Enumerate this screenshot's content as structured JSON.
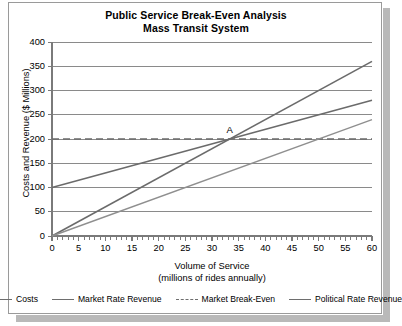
{
  "chart_data": {
    "type": "line",
    "title": "Public Service Break-Even Analysis",
    "subtitle": "Mass Transit System",
    "xlabel": "Volume of Service",
    "xlabel_sub": "(millions of rides annually)",
    "ylabel": "Costs and Revenue ($ Millions)",
    "xlim": [
      0,
      60
    ],
    "ylim": [
      0,
      400
    ],
    "xticks": [
      0,
      5,
      10,
      15,
      20,
      25,
      30,
      35,
      40,
      45,
      50,
      55,
      60
    ],
    "xtick_labels": [
      "0",
      "5",
      "10",
      "15",
      "20",
      "25",
      "30",
      "35",
      "40",
      "45",
      "50",
      "55",
      "60"
    ],
    "x_minor_tick_step": 1,
    "yticks": [
      0,
      50,
      100,
      150,
      200,
      250,
      300,
      350,
      400
    ],
    "ytick_labels": [
      "0",
      "50",
      "100",
      "150",
      "200",
      "250",
      "300",
      "350",
      "400"
    ],
    "grid": "horizontal",
    "legend_position": "bottom",
    "series": [
      {
        "name": "Costs",
        "style": "solid",
        "color": "#6b6b6b",
        "width": 1.6,
        "x": [
          0,
          60
        ],
        "y": [
          100,
          280
        ]
      },
      {
        "name": "Market Rate Revenue",
        "style": "solid",
        "color": "#6b6b6b",
        "width": 1.6,
        "x": [
          0,
          60
        ],
        "y": [
          0,
          360
        ]
      },
      {
        "name": "Market Break-Even",
        "style": "dashed",
        "color": "#6b6b6b",
        "width": 1.6,
        "x": [
          0,
          60
        ],
        "y": [
          200,
          200
        ]
      },
      {
        "name": "Political Rate Revenue",
        "style": "solid",
        "color": "#8f8f8f",
        "width": 1.4,
        "x": [
          0,
          60
        ],
        "y": [
          0,
          240
        ]
      }
    ],
    "annotations": [
      {
        "label": "A",
        "x": 33.3,
        "y": 200,
        "note": "Break-even intersection of Costs and Market Rate Revenue"
      }
    ]
  },
  "legend": {
    "items": [
      {
        "label": "Costs",
        "style": "solid"
      },
      {
        "label": "Market Rate Revenue",
        "style": "solid"
      },
      {
        "label": "Market Break-Even",
        "style": "dashed"
      },
      {
        "label": "Political Rate Revenue",
        "style": "solid"
      }
    ]
  },
  "colors": {
    "axis": "#7a7a7a",
    "grid": "#8a8a8a",
    "text": "#000000",
    "frame": "#9a9a9a",
    "shadow": "#b9b9b9"
  }
}
